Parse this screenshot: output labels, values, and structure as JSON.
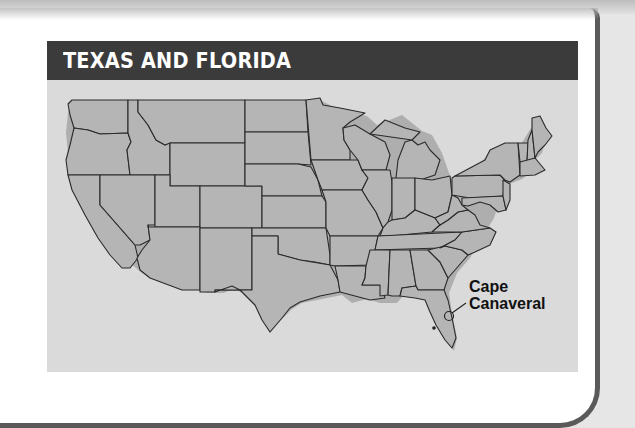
{
  "title": "TEXAS AND FLORIDA",
  "map": {
    "region": "Contiguous United States",
    "annotations": [
      {
        "label_line1": "Cape",
        "label_line2": "Canaveral",
        "marker": "circle"
      }
    ]
  },
  "colors": {
    "title_bar": "#3b3b3b",
    "title_text": "#ffffff",
    "map_background": "#dadada",
    "state_fill": "#b5b5b5",
    "state_border": "#2a2a2a",
    "frame_border": "#5a5a5a"
  }
}
